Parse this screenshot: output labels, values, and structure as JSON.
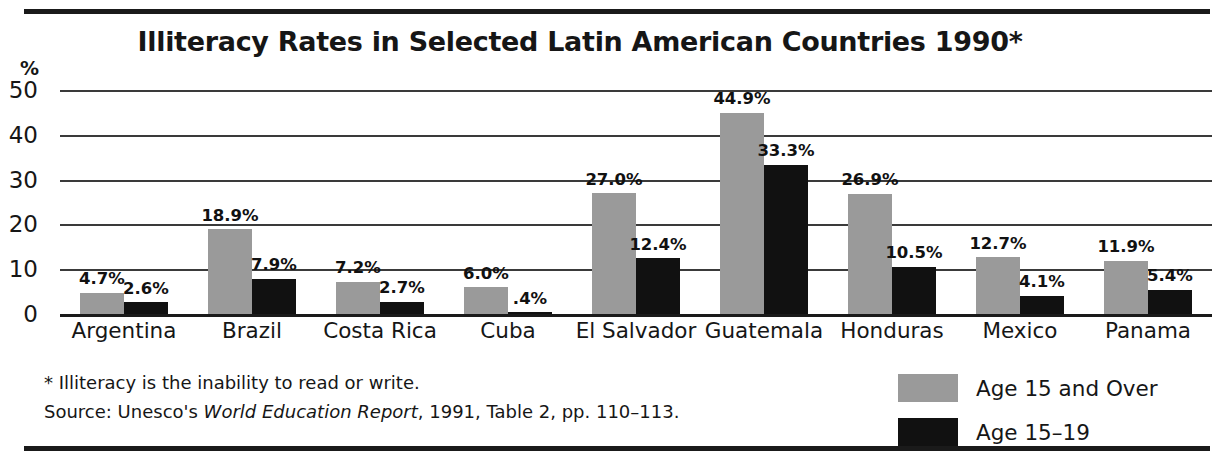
{
  "chart_data": {
    "type": "bar",
    "title": "Illiteracy Rates in Selected Latin American Countries 1990*",
    "xlabel": "",
    "ylabel": "%",
    "ylim": [
      0,
      50
    ],
    "yticks": [
      "50",
      "40",
      "30",
      "20",
      "10",
      "0"
    ],
    "grid": true,
    "legend_position": "bottom-right",
    "categories": [
      "Argentina",
      "Brazil",
      "Costa Rica",
      "Cuba",
      "El Salvador",
      "Guatemala",
      "Honduras",
      "Mexico",
      "Panama"
    ],
    "series": [
      {
        "name": "Age 15 and Over",
        "color": "#9a9a9a",
        "values": [
          4.7,
          18.9,
          7.2,
          6.0,
          27.0,
          44.9,
          26.9,
          12.7,
          11.9
        ],
        "labels": [
          "4.7%",
          "18.9%",
          "7.2%",
          "6.0%",
          "27.0%",
          "44.9%",
          "26.9%",
          "12.7%",
          "11.9%"
        ]
      },
      {
        "name": "Age 15–19",
        "color": "#111111",
        "values": [
          2.6,
          7.9,
          2.7,
          0.4,
          12.4,
          33.3,
          10.5,
          4.1,
          5.4
        ],
        "labels": [
          "2.6%",
          "7.9%",
          "2.7%",
          ".4%",
          "12.4%",
          "33.3%",
          "10.5%",
          "4.1%",
          "5.4%"
        ]
      }
    ],
    "annotations": [
      "* Illiteracy is the inability to read or write.",
      "Source:  Unesco's World Education Report, 1991, Table 2, pp. 110–113."
    ]
  },
  "axis": {
    "unit_label": "%",
    "ticks": [
      "50",
      "40",
      "30",
      "20",
      "10",
      "0"
    ]
  },
  "footnotes": {
    "definition": "* Illiteracy is the inability to read or write.",
    "source_prefix": "Source:  Unesco's ",
    "source_title": "World Education Report",
    "source_suffix": ", 1991, Table 2, pp. 110–113."
  },
  "legend": {
    "items": [
      {
        "label": "Age 15 and Over",
        "color": "#9a9a9a"
      },
      {
        "label": "Age 15–19",
        "color": "#111111"
      }
    ]
  }
}
